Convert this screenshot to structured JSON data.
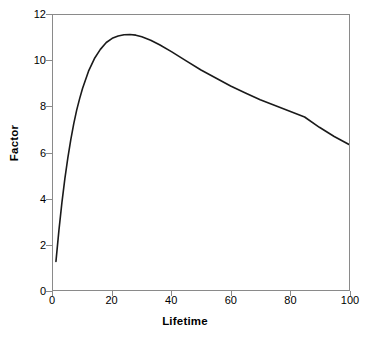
{
  "chart_data": {
    "type": "line",
    "title": "",
    "xlabel": "Lifetime",
    "ylabel": "Factor",
    "xlim": [
      0,
      100
    ],
    "ylim": [
      0,
      12
    ],
    "xticks": [
      "0",
      "20",
      "40",
      "60",
      "80",
      "100"
    ],
    "yticks": [
      "0",
      "2",
      "4",
      "6",
      "8",
      "10",
      "12"
    ],
    "grid": false,
    "legend": "none",
    "line_color": "#1a1a1a",
    "axis_color": "#8a8a8a",
    "background_color": "#ffffff",
    "series": [
      {
        "name": "Factor",
        "x": [
          1,
          2,
          3,
          4,
          5,
          6,
          7,
          8,
          9,
          10,
          12,
          14,
          16,
          18,
          20,
          22,
          24,
          26,
          28,
          30,
          33,
          36,
          40,
          45,
          50,
          55,
          60,
          65,
          70,
          75,
          80,
          85,
          90,
          95,
          100
        ],
        "values": [
          1.25,
          2.6,
          3.8,
          4.85,
          5.75,
          6.55,
          7.25,
          7.85,
          8.35,
          8.8,
          9.55,
          10.1,
          10.5,
          10.8,
          10.98,
          11.08,
          11.14,
          11.15,
          11.12,
          11.05,
          10.9,
          10.7,
          10.4,
          10.0,
          9.6,
          9.25,
          8.9,
          8.6,
          8.3,
          8.05,
          7.8,
          7.55,
          7.1,
          6.7,
          6.35
        ]
      }
    ],
    "annotations": {
      "peak_x": 26,
      "peak_y": 11.15,
      "start_x": 1,
      "start_y": 1.25,
      "end_x": 100,
      "end_y": 6.35
    }
  }
}
